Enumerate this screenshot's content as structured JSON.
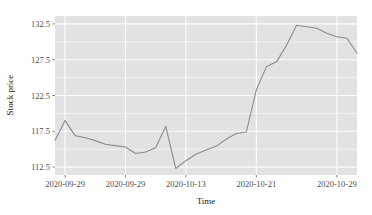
{
  "chart_data": {
    "type": "line",
    "title": "",
    "subtitle": "",
    "xlabel": "Time",
    "ylabel": "Stock price",
    "grid": true,
    "legend": false,
    "legend_position": "none",
    "theme": "gray-panel-white-grid",
    "line_color": "#8c8c8c",
    "panel_color": "#e2e2e2",
    "grid_color": "#fdfdfd",
    "xlim": [
      0,
      30
    ],
    "ylim": [
      111.4,
      133.6
    ],
    "y_ticks": [
      112.5,
      117.5,
      122.5,
      127.5,
      132.5
    ],
    "y_tick_labels": [
      "112.5",
      "117.5",
      "122.5",
      "127.5",
      "132.5"
    ],
    "x_ticks": [
      1,
      7,
      13,
      20,
      28
    ],
    "x_tick_labels": [
      "2020-09-29",
      "2020-09-29",
      "2020-10-13",
      "2020-10-21",
      "2020-10-29"
    ],
    "x": [
      0,
      1,
      2,
      3,
      4,
      5,
      6,
      7,
      8,
      9,
      10,
      11,
      12,
      13,
      14,
      15,
      16,
      17,
      18,
      19,
      20,
      21,
      22,
      23,
      24,
      25,
      26,
      27,
      28,
      29,
      30
    ],
    "values": [
      116.2,
      119.0,
      116.9,
      116.6,
      116.2,
      115.7,
      115.5,
      115.3,
      114.4,
      114.6,
      115.2,
      118.2,
      112.3,
      113.4,
      114.3,
      114.9,
      115.4,
      116.4,
      117.2,
      117.4,
      123.3,
      126.5,
      127.2,
      129.5,
      132.3,
      132.1,
      131.9,
      131.2,
      130.7,
      130.5,
      128.4
    ],
    "series_name": "Stock price",
    "n_points": 31,
    "y_min": 112.3,
    "y_max": 132.3
  },
  "axis": {
    "y_title": "Stock price",
    "x_title": "Time"
  }
}
